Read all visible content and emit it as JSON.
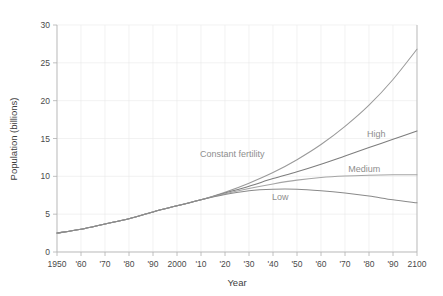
{
  "chart_data": {
    "type": "line",
    "title": "",
    "xlabel": "Year",
    "ylabel": "Population (billions)",
    "xlim": [
      1950,
      2100
    ],
    "ylim": [
      0,
      30
    ],
    "grid": true,
    "legend": "inline-annotations",
    "x_tick_labels": [
      "1950",
      "'60",
      "'70",
      "'80",
      "'90",
      "2000",
      "'10",
      "'20",
      "'30",
      "'40",
      "'50",
      "'60",
      "'70",
      "'80",
      "'90",
      "2100"
    ],
    "x_tick_values": [
      1950,
      1960,
      1970,
      1980,
      1990,
      2000,
      2010,
      2020,
      2030,
      2040,
      2050,
      2060,
      2070,
      2080,
      2090,
      2100
    ],
    "y_tick_labels": [
      "0",
      "5",
      "10",
      "15",
      "20",
      "25",
      "30"
    ],
    "y_tick_values": [
      0,
      5,
      10,
      15,
      20,
      25,
      30
    ],
    "x": [
      1950,
      1960,
      1970,
      1980,
      1990,
      2000,
      2010,
      2020,
      2030,
      2040,
      2050,
      2060,
      2070,
      2080,
      2090,
      2100
    ],
    "series": [
      {
        "name": "Constant fertility",
        "color": "#9a9a9a",
        "values": [
          2.5,
          3.0,
          3.7,
          4.4,
          5.3,
          6.1,
          6.9,
          7.9,
          9.1,
          10.5,
          12.2,
          14.2,
          16.6,
          19.4,
          22.8,
          26.8
        ]
      },
      {
        "name": "High",
        "color": "#7d7d7d",
        "values": [
          2.5,
          3.0,
          3.7,
          4.4,
          5.3,
          6.1,
          6.9,
          7.8,
          8.7,
          9.7,
          10.6,
          11.6,
          12.7,
          13.8,
          14.9,
          16.0
        ]
      },
      {
        "name": "Medium",
        "color": "#a5a5a5",
        "values": [
          2.5,
          3.0,
          3.7,
          4.4,
          5.3,
          6.1,
          6.9,
          7.7,
          8.4,
          9.0,
          9.5,
          9.85,
          10.05,
          10.15,
          10.2,
          10.2
        ]
      },
      {
        "name": "Low",
        "color": "#8a8a8a",
        "values": [
          2.5,
          3.0,
          3.7,
          4.4,
          5.3,
          6.1,
          6.9,
          7.6,
          8.1,
          8.3,
          8.3,
          8.1,
          7.8,
          7.4,
          6.9,
          6.5
        ]
      }
    ],
    "annotations": [
      {
        "text": "Constant fertility",
        "x": 2023,
        "y": 12.6
      },
      {
        "text": "High",
        "x": 2083,
        "y": 15.2
      },
      {
        "text": "Medium",
        "x": 2078,
        "y": 10.6
      },
      {
        "text": "Low",
        "x": 2043,
        "y": 6.9
      }
    ]
  }
}
